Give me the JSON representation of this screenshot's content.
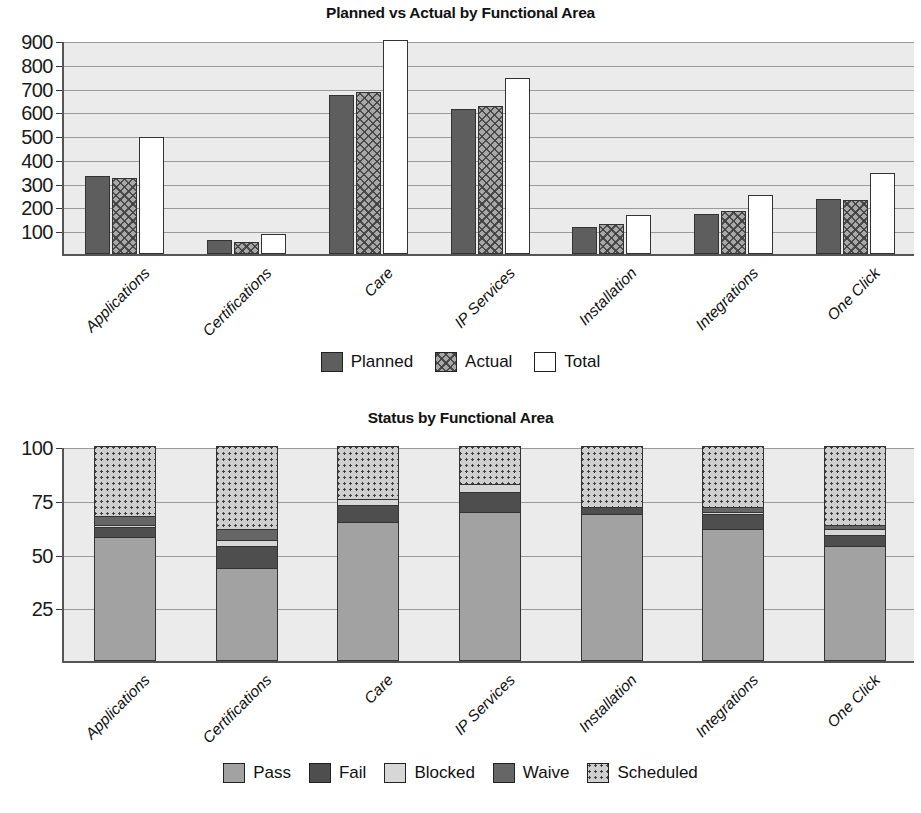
{
  "chart_data": [
    {
      "type": "bar",
      "title": "Planned vs Actual by Functional Area",
      "xlabel": "",
      "ylabel": "",
      "ylim": [
        0,
        900
      ],
      "yticks": [
        100,
        200,
        300,
        400,
        500,
        600,
        700,
        800,
        900
      ],
      "grid": true,
      "legend_position": "bottom",
      "categories": [
        "Applications",
        "Certifications",
        "Care",
        "IP Services",
        "Installation",
        "Integrations",
        "One Click"
      ],
      "series": [
        {
          "name": "Planned",
          "values": [
            330,
            60,
            670,
            610,
            115,
            167,
            230
          ],
          "color": "#5e5e5e",
          "pattern": "solid"
        },
        {
          "name": "Actual",
          "values": [
            318,
            50,
            682,
            622,
            128,
            180,
            228
          ],
          "color": "#a8a8a8",
          "pattern": "crosshatch"
        },
        {
          "name": "Total",
          "values": [
            492,
            85,
            900,
            740,
            163,
            250,
            342
          ],
          "color": "#ffffff",
          "pattern": "none"
        }
      ]
    },
    {
      "type": "bar",
      "subtype": "stacked",
      "title": "Status by Functional Area",
      "xlabel": "",
      "ylabel": "",
      "ylim": [
        0,
        100
      ],
      "yticks": [
        25,
        50,
        75,
        100
      ],
      "grid": true,
      "legend_position": "bottom",
      "categories": [
        "Applications",
        "Certifications",
        "Care",
        "IP Services",
        "Installation",
        "Integrations",
        "One Click"
      ],
      "series": [
        {
          "name": "Pass",
          "values": [
            57,
            43,
            64,
            69,
            68,
            61,
            53
          ],
          "color": "#a2a2a2",
          "pattern": "solid"
        },
        {
          "name": "Fail",
          "values": [
            5,
            10,
            8,
            9,
            3,
            7,
            5
          ],
          "color": "#4e4e4e",
          "pattern": "solid"
        },
        {
          "name": "Blocked",
          "values": [
            1,
            3,
            3,
            4,
            0,
            1,
            3
          ],
          "color": "#d7d7d7",
          "pattern": "solid"
        },
        {
          "name": "Waive",
          "values": [
            4,
            5,
            0,
            0,
            0,
            2,
            2
          ],
          "color": "#666666",
          "pattern": "solid"
        },
        {
          "name": "Scheduled",
          "values": [
            33,
            39,
            25,
            18,
            29,
            29,
            37
          ],
          "color": "#cfcfcf",
          "pattern": "dotted"
        }
      ]
    }
  ],
  "chart1": {
    "title": "Planned vs Actual by Functional Area",
    "yticks": [
      "900",
      "800",
      "700",
      "600",
      "500",
      "400",
      "300",
      "200",
      "100"
    ],
    "categories": [
      "Applications",
      "Certifications",
      "Care",
      "IP Services",
      "Installation",
      "Integrations",
      "One Click"
    ],
    "legend": [
      {
        "label": "Planned",
        "swatch": "planned-swatch"
      },
      {
        "label": "Actual",
        "swatch": "actual-swatch"
      },
      {
        "label": "Total",
        "swatch": "total-swatch"
      }
    ]
  },
  "chart2": {
    "title": "Status by Functional Area",
    "yticks": [
      "100",
      "75",
      "50",
      "25"
    ],
    "categories": [
      "Applications",
      "Certifications",
      "Care",
      "IP Services",
      "Installation",
      "Integrations",
      "One Click"
    ],
    "legend": [
      {
        "label": "Pass",
        "swatch": "pass-swatch"
      },
      {
        "label": "Fail",
        "swatch": "fail-swatch"
      },
      {
        "label": "Blocked",
        "swatch": "blocked-swatch"
      },
      {
        "label": "Waive",
        "swatch": "waive-swatch"
      },
      {
        "label": "Scheduled",
        "swatch": "scheduled-swatch"
      }
    ]
  },
  "colors": {
    "plot_background": "#ebebeb",
    "gridline": "#9a9a9a",
    "axis": "#555555",
    "planned": "#5e5e5e",
    "actual": "#a8a8a8",
    "total": "#ffffff",
    "pass": "#a2a2a2",
    "fail": "#4e4e4e",
    "blocked": "#d7d7d7",
    "waive": "#666666",
    "scheduled": "#cfcfcf"
  }
}
